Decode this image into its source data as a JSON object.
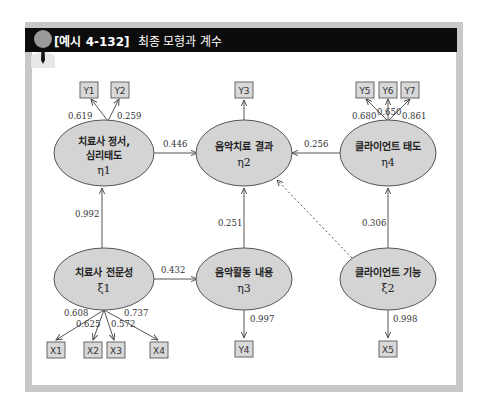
{
  "header": {
    "figure_label": "[예시 4-132]",
    "title": "최종 모형과 계수"
  },
  "nodes": {
    "eta1": {
      "line1": "치료사 정서,",
      "line2": "심리태도",
      "symbol": "η1"
    },
    "eta2": {
      "line1": "음악치료 결과",
      "symbol": "η2"
    },
    "eta4": {
      "line1": "클라이언트 태도",
      "symbol": "η4"
    },
    "xi1": {
      "line1": "치료사 전문성",
      "symbol": "ξ1"
    },
    "eta3": {
      "line1": "음악활동 내용",
      "symbol": "η3"
    },
    "xi2": {
      "line1": "클라이언트 기능",
      "symbol": "ξ2"
    }
  },
  "indicators": {
    "Y1": "Y1",
    "Y2": "Y2",
    "Y3": "Y3",
    "Y4": "Y4",
    "Y5": "Y5",
    "Y6": "Y6",
    "Y7": "Y7",
    "X1": "X1",
    "X2": "X2",
    "X3": "X3",
    "X4": "X4",
    "X5": "X5"
  },
  "coefficients": {
    "eta1_Y1": "0.619",
    "eta1_Y2": "0.259",
    "eta4_Y5": "0.680",
    "eta4_Y6": "0.650",
    "eta4_Y7": "0.861",
    "eta1_eta2": "0.446",
    "eta4_eta2": "0.256",
    "xi1_eta1": "0.992",
    "eta3_eta2": "0.251",
    "xi2_eta4": "0.306",
    "xi1_eta3": "0.432",
    "xi1_X1": "0.608",
    "xi1_X2": "0.625",
    "xi1_X3": "0.572",
    "xi1_X4": "0.737",
    "eta3_Y4": "0.997",
    "xi2_X5": "0.998"
  },
  "colors": {
    "header_bg": "#0c0c0c",
    "frame": "#c8c8c8",
    "node_fill": "#d4d4d4",
    "box_fill": "#d8d8d8"
  }
}
